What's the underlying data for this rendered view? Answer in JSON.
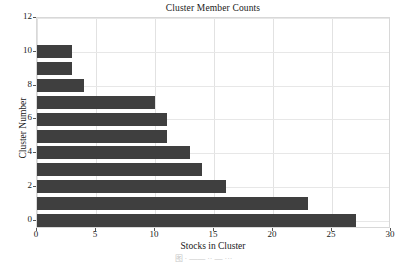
{
  "chart_data": {
    "type": "bar",
    "orientation": "horizontal",
    "title": "Cluster Member Counts",
    "xlabel": "Stocks in Cluster",
    "ylabel": "Cluster Number",
    "categories": [
      0,
      1,
      2,
      3,
      4,
      5,
      6,
      7,
      8,
      9,
      10
    ],
    "values": [
      27,
      23,
      16,
      14,
      13,
      11,
      11,
      10,
      4,
      3,
      3
    ],
    "series": [
      {
        "name": "Stocks in Cluster",
        "values": [
          27,
          23,
          16,
          14,
          13,
          11,
          11,
          10,
          4,
          3,
          3
        ]
      }
    ],
    "xlim": [
      0,
      30
    ],
    "ylim": [
      -0.5,
      12
    ],
    "xticks": [
      0,
      5,
      10,
      15,
      20,
      25,
      30
    ],
    "yticks": [
      0,
      2,
      4,
      6,
      8,
      10,
      12
    ],
    "xtick_labels": [
      "0",
      "5",
      "10",
      "15",
      "20",
      "25",
      "30"
    ],
    "ytick_labels": [
      "0",
      "2",
      "4",
      "6",
      "8",
      "10",
      "12"
    ],
    "grid": true,
    "legend": false,
    "bar_color": "#3f3f3f",
    "grid_color": "#e2e2e2",
    "background": "#ffffff"
  },
  "caption": {
    "fragment": "图  ·  ——  ··  —  ···"
  }
}
